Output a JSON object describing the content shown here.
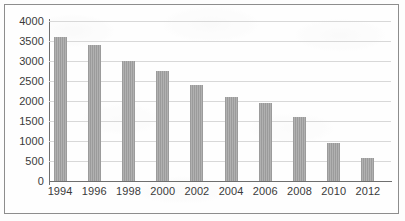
{
  "chart_data": {
    "type": "bar",
    "title": "",
    "xlabel": "",
    "ylabel": "",
    "categories": [
      "1994",
      "1996",
      "1998",
      "2000",
      "2002",
      "2004",
      "2006",
      "2008",
      "2010",
      "2012"
    ],
    "values": [
      3600,
      3400,
      3000,
      2750,
      2400,
      2100,
      1950,
      1600,
      950,
      570
    ],
    "ylim": [
      0,
      4000
    ],
    "y_ticks": [
      0,
      500,
      1000,
      1500,
      2000,
      2500,
      3000,
      3500,
      4000
    ],
    "y_tick_labels": [
      "0",
      "500",
      "1000",
      "1500",
      "2000",
      "2500",
      "3000",
      "3500",
      "4000"
    ],
    "grid": true,
    "legend": null,
    "legend_position": "none",
    "series": [
      {
        "name": "",
        "values": [
          3600,
          3400,
          3000,
          2750,
          2400,
          2100,
          1950,
          1600,
          950,
          570
        ]
      }
    ]
  },
  "style": {
    "bar_color": "#9b9b9b",
    "gridline_color": "#d8d8d8",
    "axis_color": "#6f6f6f",
    "frame_color": "#8d8d8d",
    "text_color": "#3a3a3a",
    "background_color": "#fdfdfd"
  }
}
